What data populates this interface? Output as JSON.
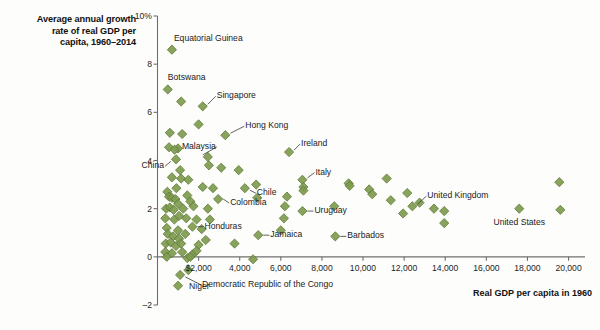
{
  "title": {
    "line1": "Average annual growth",
    "line2": "rate of real GDP per",
    "line3": "capita, 1960–2014"
  },
  "axes": {
    "y_title": "",
    "x_title": "Real GDP per capita in 1960",
    "y_ticks": [
      "10%",
      "8",
      "6",
      "4",
      "2",
      "0",
      "–2"
    ],
    "x_ticks": [
      "$2,000",
      "4,000",
      "6,000",
      "8,000",
      "10,000",
      "12,000",
      "14,000",
      "16,000",
      "18,000",
      "20,000"
    ]
  },
  "colors": {
    "marker_fill": "#7d9b4e",
    "marker_stroke": "#5f7a36",
    "axis": "#6f6f6f",
    "text": "#1b1b1b",
    "background": "#fdfdfc"
  },
  "annotations": [
    {
      "label": "Equatorial Guinea",
      "x": 700,
      "y": 8.6
    },
    {
      "label": "Botswana",
      "x": 500,
      "y": 6.95
    },
    {
      "label": "Singapore",
      "x": 2200,
      "y": 6.25
    },
    {
      "label": "Hong Kong",
      "x": 3300,
      "y": 5.05
    },
    {
      "label": "Malaysia",
      "x": 2450,
      "y": 4.15
    },
    {
      "label": "China",
      "x": 900,
      "y": 4.05
    },
    {
      "label": "Ireland",
      "x": 6400,
      "y": 4.35
    },
    {
      "label": "Italy",
      "x": 7050,
      "y": 3.2
    },
    {
      "label": "Chile",
      "x": 4250,
      "y": 2.85
    },
    {
      "label": "Colombia",
      "x": 2950,
      "y": 2.4
    },
    {
      "label": "Uruguay",
      "x": 7050,
      "y": 1.9
    },
    {
      "label": "United Kingdom",
      "x": 12400,
      "y": 2.1
    },
    {
      "label": "United States",
      "x": 17600,
      "y": 2.0
    },
    {
      "label": "Honduras",
      "x": 1700,
      "y": 1.25
    },
    {
      "label": "Jamaica",
      "x": 4900,
      "y": 0.9
    },
    {
      "label": "Barbados",
      "x": 8650,
      "y": 0.85
    },
    {
      "label": "Democratic Republic of the Congo",
      "x": 1100,
      "y": -0.75
    },
    {
      "label": "Niger",
      "x": 1000,
      "y": -1.2
    }
  ],
  "chart_data": {
    "type": "scatter",
    "title": "Average annual growth rate of real GDP per capita, 1960–2014",
    "xlabel": "Real GDP per capita in 1960",
    "ylabel": "Average annual growth rate of real GDP per capita, 1960–2014 (%)",
    "xlim": [
      0,
      20800
    ],
    "ylim": [
      -2,
      10
    ],
    "xticks": [
      2000,
      4000,
      6000,
      8000,
      10000,
      12000,
      14000,
      16000,
      18000,
      20000
    ],
    "yticks": [
      -2,
      0,
      2,
      4,
      6,
      8,
      10
    ],
    "grid": false,
    "legend": null,
    "marker": "diamond",
    "series": [
      {
        "name": "Countries",
        "color": "#7d9b4e",
        "points": [
          {
            "x": 700,
            "y": 8.6,
            "label": "Equatorial Guinea"
          },
          {
            "x": 500,
            "y": 6.95,
            "label": "Botswana"
          },
          {
            "x": 1150,
            "y": 6.45,
            "label": null
          },
          {
            "x": 2200,
            "y": 6.25,
            "label": "Singapore"
          },
          {
            "x": 2000,
            "y": 5.5,
            "label": null
          },
          {
            "x": 600,
            "y": 5.15,
            "label": null
          },
          {
            "x": 1200,
            "y": 5.1,
            "label": null
          },
          {
            "x": 3300,
            "y": 5.05,
            "label": "Hong Kong"
          },
          {
            "x": 560,
            "y": 4.55,
            "label": null
          },
          {
            "x": 1000,
            "y": 4.5,
            "label": null
          },
          {
            "x": 830,
            "y": 4.45,
            "label": null
          },
          {
            "x": 2450,
            "y": 4.15,
            "label": "Malaysia"
          },
          {
            "x": 900,
            "y": 4.05,
            "label": "China"
          },
          {
            "x": 6400,
            "y": 4.35,
            "label": "Ireland"
          },
          {
            "x": 2500,
            "y": 3.8,
            "label": null
          },
          {
            "x": 3100,
            "y": 3.7,
            "label": null
          },
          {
            "x": 1100,
            "y": 3.6,
            "label": null
          },
          {
            "x": 3950,
            "y": 3.6,
            "label": null
          },
          {
            "x": 700,
            "y": 3.3,
            "label": null
          },
          {
            "x": 1150,
            "y": 3.25,
            "label": null
          },
          {
            "x": 1500,
            "y": 3.2,
            "label": null
          },
          {
            "x": 7050,
            "y": 3.2,
            "label": "Italy"
          },
          {
            "x": 9300,
            "y": 3.05,
            "label": null
          },
          {
            "x": 9350,
            "y": 2.95,
            "label": null
          },
          {
            "x": 11150,
            "y": 3.25,
            "label": null
          },
          {
            "x": 19550,
            "y": 3.1,
            "label": null
          },
          {
            "x": 480,
            "y": 2.7,
            "label": null
          },
          {
            "x": 920,
            "y": 2.85,
            "label": null
          },
          {
            "x": 2200,
            "y": 2.9,
            "label": null
          },
          {
            "x": 2700,
            "y": 2.85,
            "label": null
          },
          {
            "x": 4250,
            "y": 2.85,
            "label": "Chile"
          },
          {
            "x": 4800,
            "y": 3.0,
            "label": null
          },
          {
            "x": 7100,
            "y": 2.9,
            "label": null
          },
          {
            "x": 10300,
            "y": 2.8,
            "label": null
          },
          {
            "x": 10450,
            "y": 2.6,
            "label": null
          },
          {
            "x": 12150,
            "y": 2.65,
            "label": null
          },
          {
            "x": 560,
            "y": 2.5,
            "label": null
          },
          {
            "x": 700,
            "y": 2.45,
            "label": null
          },
          {
            "x": 870,
            "y": 2.4,
            "label": null
          },
          {
            "x": 1000,
            "y": 2.2,
            "label": null
          },
          {
            "x": 1450,
            "y": 2.55,
            "label": null
          },
          {
            "x": 1600,
            "y": 2.3,
            "label": null
          },
          {
            "x": 2950,
            "y": 2.4,
            "label": "Colombia"
          },
          {
            "x": 4850,
            "y": 2.45,
            "label": null
          },
          {
            "x": 6300,
            "y": 2.5,
            "label": null
          },
          {
            "x": 7100,
            "y": 2.75,
            "label": null
          },
          {
            "x": 11350,
            "y": 2.35,
            "label": null
          },
          {
            "x": 12400,
            "y": 2.1,
            "label": "United Kingdom"
          },
          {
            "x": 12750,
            "y": 2.25,
            "label": null
          },
          {
            "x": 420,
            "y": 2.0,
            "label": null
          },
          {
            "x": 600,
            "y": 2.05,
            "label": null
          },
          {
            "x": 780,
            "y": 1.95,
            "label": null
          },
          {
            "x": 1250,
            "y": 2.0,
            "label": null
          },
          {
            "x": 1750,
            "y": 2.1,
            "label": null
          },
          {
            "x": 2450,
            "y": 2.0,
            "label": null
          },
          {
            "x": 6200,
            "y": 2.1,
            "label": null
          },
          {
            "x": 8600,
            "y": 2.1,
            "label": null
          },
          {
            "x": 13450,
            "y": 2.0,
            "label": null
          },
          {
            "x": 13950,
            "y": 1.9,
            "label": null
          },
          {
            "x": 17600,
            "y": 2.0,
            "label": "United States"
          },
          {
            "x": 19600,
            "y": 1.95,
            "label": null
          },
          {
            "x": 380,
            "y": 1.6,
            "label": null
          },
          {
            "x": 820,
            "y": 1.55,
            "label": null
          },
          {
            "x": 1050,
            "y": 1.7,
            "label": null
          },
          {
            "x": 1400,
            "y": 1.6,
            "label": null
          },
          {
            "x": 1900,
            "y": 1.55,
            "label": null
          },
          {
            "x": 2550,
            "y": 1.55,
            "label": null
          },
          {
            "x": 7050,
            "y": 1.9,
            "label": "Uruguay"
          },
          {
            "x": 6150,
            "y": 1.6,
            "label": null
          },
          {
            "x": 11950,
            "y": 1.8,
            "label": null
          },
          {
            "x": 13950,
            "y": 1.4,
            "label": null
          },
          {
            "x": 1700,
            "y": 1.25,
            "label": "Honduras"
          },
          {
            "x": 450,
            "y": 1.2,
            "label": null
          },
          {
            "x": 1000,
            "y": 1.1,
            "label": null
          },
          {
            "x": 2150,
            "y": 1.15,
            "label": null
          },
          {
            "x": 6000,
            "y": 1.1,
            "label": null
          },
          {
            "x": 500,
            "y": 0.95,
            "label": null
          },
          {
            "x": 760,
            "y": 0.85,
            "label": null
          },
          {
            "x": 1050,
            "y": 0.75,
            "label": null
          },
          {
            "x": 1350,
            "y": 0.95,
            "label": null
          },
          {
            "x": 2350,
            "y": 0.7,
            "label": null
          },
          {
            "x": 4900,
            "y": 0.9,
            "label": "Jamaica"
          },
          {
            "x": 8650,
            "y": 0.85,
            "label": "Barbados"
          },
          {
            "x": 400,
            "y": 0.55,
            "label": null
          },
          {
            "x": 640,
            "y": 0.6,
            "label": null
          },
          {
            "x": 900,
            "y": 0.45,
            "label": null
          },
          {
            "x": 1150,
            "y": 0.55,
            "label": null
          },
          {
            "x": 2000,
            "y": 0.5,
            "label": null
          },
          {
            "x": 3750,
            "y": 0.55,
            "label": null
          },
          {
            "x": 380,
            "y": 0.2,
            "label": null
          },
          {
            "x": 700,
            "y": 0.15,
            "label": null
          },
          {
            "x": 1200,
            "y": 0.2,
            "label": null
          },
          {
            "x": 1700,
            "y": 0.1,
            "label": null
          },
          {
            "x": 1900,
            "y": 0.25,
            "label": null
          },
          {
            "x": 450,
            "y": 0.0,
            "label": null
          },
          {
            "x": 1450,
            "y": -0.05,
            "label": null
          },
          {
            "x": 1600,
            "y": 0.0,
            "label": null
          },
          {
            "x": 4650,
            "y": -0.1,
            "label": null
          },
          {
            "x": 1100,
            "y": -0.75,
            "label": "Democratic Republic of the Congo"
          },
          {
            "x": 1500,
            "y": -0.55,
            "label": null
          },
          {
            "x": 1000,
            "y": -1.2,
            "label": "Niger"
          }
        ]
      }
    ]
  }
}
